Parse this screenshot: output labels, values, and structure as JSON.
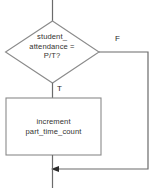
{
  "diagram": {
    "background_color": "#ffffff",
    "shape_stroke_color": "#8a8a8a",
    "connector_color": "#6b6b6b",
    "text_color": "#33322f",
    "nodes": {
      "decision": {
        "shape": "diamond",
        "line1": "student_",
        "line2": "attendance =",
        "line3": "P/T?",
        "text": "student_\nattendance =\nP/T?"
      },
      "process": {
        "shape": "rectangle",
        "line1": "increment",
        "line2": "part_time_count",
        "text": "increment\npart_time_count"
      }
    },
    "edge_labels": {
      "false_branch": "F",
      "true_branch": "T"
    }
  }
}
